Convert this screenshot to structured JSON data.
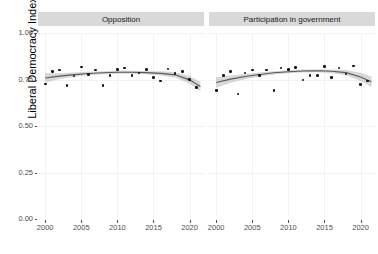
{
  "chart_data": {
    "type": "scatter",
    "title": "",
    "xlabel": "",
    "ylabel": "Liberal Democracy Index",
    "xlim": [
      1999,
      2022
    ],
    "ylim": [
      0.0,
      1.0
    ],
    "grid": true,
    "legend": "none",
    "facet_variable": "party_status",
    "y_ticks": [
      "0.00",
      "0.25",
      "0.50",
      "0.75",
      "1.00"
    ],
    "y_tick_values": [
      0.0,
      0.25,
      0.5,
      0.75,
      1.0
    ],
    "x_ticks": [
      "2000",
      "2005",
      "2010",
      "2015",
      "2020"
    ],
    "x_tick_values": [
      2000,
      2005,
      2010,
      2015,
      2020
    ],
    "panels": [
      {
        "label": "Opposition",
        "x": [
          2000,
          2001,
          2002,
          2003,
          2004,
          2005,
          2006,
          2007,
          2008,
          2009,
          2010,
          2011,
          2012,
          2013,
          2014,
          2015,
          2016,
          2017,
          2018,
          2019,
          2020,
          2021
        ],
        "values": [
          0.726,
          0.792,
          0.8,
          0.718,
          0.768,
          0.818,
          0.778,
          0.8,
          0.718,
          0.772,
          0.805,
          0.812,
          0.77,
          0.784,
          0.803,
          0.76,
          0.742,
          0.806,
          0.782,
          0.792,
          0.75,
          0.708
        ],
        "fit": {
          "x": [
            2000,
            2002,
            2004,
            2006,
            2008,
            2010,
            2012,
            2014,
            2016,
            2018,
            2020,
            2021.5
          ],
          "y": [
            0.758,
            0.768,
            0.776,
            0.782,
            0.786,
            0.789,
            0.789,
            0.787,
            0.783,
            0.775,
            0.748,
            0.712
          ],
          "lower": [
            0.733,
            0.753,
            0.765,
            0.773,
            0.778,
            0.781,
            0.781,
            0.778,
            0.772,
            0.761,
            0.727,
            0.686
          ],
          "upper": [
            0.784,
            0.784,
            0.788,
            0.792,
            0.795,
            0.797,
            0.797,
            0.796,
            0.794,
            0.789,
            0.769,
            0.738
          ]
        }
      },
      {
        "label": "Participation in government",
        "x": [
          2000,
          2001,
          2002,
          2003,
          2004,
          2005,
          2006,
          2007,
          2008,
          2009,
          2010,
          2011,
          2012,
          2013,
          2014,
          2015,
          2016,
          2017,
          2018,
          2019,
          2020,
          2021
        ],
        "values": [
          0.69,
          0.772,
          0.792,
          0.672,
          0.786,
          0.8,
          0.772,
          0.8,
          0.69,
          0.812,
          0.803,
          0.815,
          0.748,
          0.772,
          0.77,
          0.82,
          0.76,
          0.812,
          0.78,
          0.822,
          0.724,
          0.742
        ],
        "fit": {
          "x": [
            2000,
            2002,
            2004,
            2006,
            2008,
            2010,
            2012,
            2014,
            2016,
            2018,
            2020,
            2021.5
          ],
          "y": [
            0.734,
            0.752,
            0.766,
            0.777,
            0.786,
            0.792,
            0.796,
            0.797,
            0.794,
            0.787,
            0.764,
            0.738
          ],
          "lower": [
            0.706,
            0.733,
            0.752,
            0.766,
            0.777,
            0.784,
            0.788,
            0.789,
            0.784,
            0.773,
            0.742,
            0.71
          ],
          "upper": [
            0.762,
            0.771,
            0.78,
            0.788,
            0.795,
            0.8,
            0.804,
            0.805,
            0.804,
            0.801,
            0.786,
            0.766
          ]
        }
      }
    ]
  },
  "axis": {
    "y_title": "Liberal Democracy Index"
  }
}
